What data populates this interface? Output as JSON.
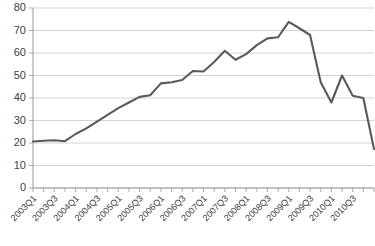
{
  "chart_data": {
    "type": "line",
    "title": "",
    "subtitle": "",
    "xlabel": "",
    "ylabel": "",
    "ylim": [
      0,
      80
    ],
    "ytick_values": [
      0,
      10,
      20,
      30,
      40,
      50,
      60,
      70,
      80
    ],
    "ytick_labels": [
      "0",
      "10",
      "20",
      "30",
      "40",
      "50",
      "60",
      "70",
      "80"
    ],
    "grid": true,
    "legend": false,
    "legend_position": "none",
    "line_color": "#5a5a5a",
    "gridline_color": "#c8c8c8",
    "axis_color": "#9a9a9a",
    "x": [
      "2003Q1",
      "2003Q2",
      "2003Q3",
      "2003Q4",
      "2004Q1",
      "2004Q2",
      "2004Q3",
      "2004Q4",
      "2005Q1",
      "2005Q2",
      "2005Q3",
      "2005Q4",
      "2006Q1",
      "2006Q2",
      "2006Q3",
      "2006Q4",
      "2007Q1",
      "2007Q2",
      "2007Q3",
      "2007Q4",
      "2008Q1",
      "2008Q2",
      "2008Q3",
      "2008Q4",
      "2009Q1",
      "2009Q2",
      "2009Q3",
      "2009Q4",
      "2010Q1",
      "2010Q2",
      "2010Q3",
      "2010Q4"
    ],
    "xtick_labels": [
      "2003Q1",
      "2003Q3",
      "2004Q1",
      "2004Q3",
      "2005Q1",
      "2005Q3",
      "2006Q1",
      "2006Q3",
      "2007Q1",
      "2007Q3",
      "2008Q1",
      "2008Q3",
      "2009Q1",
      "2009Q3",
      "2010Q1",
      "2010Q3"
    ],
    "xtick_indices": [
      0,
      2,
      4,
      6,
      8,
      10,
      12,
      14,
      16,
      18,
      20,
      22,
      24,
      26,
      28,
      30
    ],
    "values": [
      20.7,
      21.0,
      21.2,
      20.8,
      24.0,
      26.5,
      29.5,
      32.5,
      35.5,
      38.0,
      40.5,
      41.2,
      46.5,
      47.0,
      48.0,
      52.0,
      51.8,
      56.0,
      61.0,
      57.0,
      59.5,
      63.5,
      66.5,
      67.0,
      73.8,
      71.0,
      68.0,
      47.0,
      38.0,
      50.0,
      41.0,
      40.0
    ],
    "series": [
      {
        "name": "series-1",
        "values": [
          20.7,
          21.0,
          21.2,
          20.8,
          24.0,
          26.5,
          29.5,
          32.5,
          35.5,
          38.0,
          40.5,
          41.2,
          46.5,
          47.0,
          48.0,
          52.0,
          51.8,
          56.0,
          61.0,
          57.0,
          59.5,
          63.5,
          66.5,
          67.0,
          73.8,
          71.0,
          68.0,
          47.0,
          38.0,
          50.0,
          41.0,
          40.0
        ]
      }
    ],
    "notes": {
      "peak_label": "2008Q3",
      "peak_value": 73.8,
      "start_value": 20.7,
      "end_value": 17.3,
      "trough_after_peak": 38.0,
      "secondary_spike": 50.0
    }
  }
}
